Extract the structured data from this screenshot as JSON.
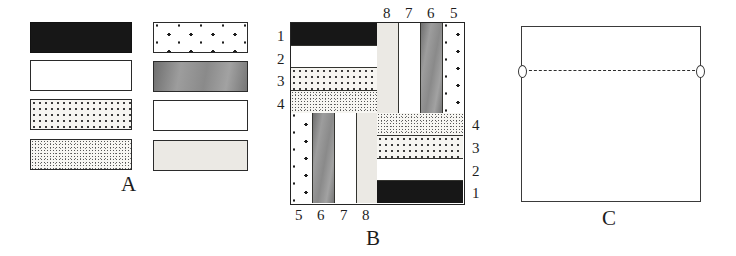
{
  "figure": {
    "panels": [
      {
        "id": "A",
        "caption": "A"
      },
      {
        "id": "B",
        "caption": "B"
      },
      {
        "id": "C",
        "caption": "C"
      }
    ]
  },
  "panel_a": {
    "caption": "A",
    "description": "Legend of eight fabric / material swatches",
    "swatches": [
      {
        "n": 1,
        "pattern": "solid-black",
        "column": "left",
        "row": 1
      },
      {
        "n": 2,
        "pattern": "plain-white",
        "column": "left",
        "row": 2
      },
      {
        "n": 3,
        "pattern": "dense-stipple",
        "column": "left",
        "row": 3
      },
      {
        "n": 4,
        "pattern": "fine-speckle",
        "column": "left",
        "row": 4
      },
      {
        "n": 5,
        "pattern": "sparse-dots",
        "column": "right",
        "row": 1
      },
      {
        "n": 6,
        "pattern": "gradient-gray",
        "column": "right",
        "row": 2
      },
      {
        "n": 7,
        "pattern": "plain-white-light",
        "column": "right",
        "row": 3
      },
      {
        "n": 8,
        "pattern": "very-light-gray",
        "column": "right",
        "row": 4
      }
    ]
  },
  "panel_b": {
    "caption": "B",
    "description": "Pinwheel block: four quadrants of four strips each, rotated 90 degrees successively",
    "labels": {
      "left": [
        "1",
        "2",
        "3",
        "4"
      ],
      "top": [
        "8",
        "7",
        "6",
        "5"
      ],
      "right": [
        "4",
        "3",
        "2",
        "1"
      ],
      "bottom": [
        "5",
        "6",
        "7",
        "8"
      ]
    },
    "quadrants": [
      {
        "name": "top-left",
        "orientation": "horizontal",
        "order": [
          1,
          2,
          3,
          4
        ]
      },
      {
        "name": "top-right",
        "orientation": "vertical",
        "order": [
          8,
          7,
          6,
          5
        ]
      },
      {
        "name": "bottom-left",
        "orientation": "vertical",
        "order": [
          5,
          6,
          7,
          8
        ]
      },
      {
        "name": "bottom-right",
        "orientation": "horizontal",
        "order": [
          4,
          3,
          2,
          1
        ]
      }
    ]
  },
  "panel_c": {
    "caption": "C",
    "description": "Plain panel with dashed fold line near the top edge"
  },
  "colors": {
    "ink": "#242424",
    "paper": "#ffffff",
    "pattern_1": "#171717",
    "pattern_2": "#ffffff",
    "pattern_3": "#f6f5f1",
    "pattern_4": "#f7f6f2",
    "pattern_5": "#ffffff",
    "pattern_6": "#8d8d8d",
    "pattern_7": "#ffffff",
    "pattern_8": "#ebe9e4"
  }
}
